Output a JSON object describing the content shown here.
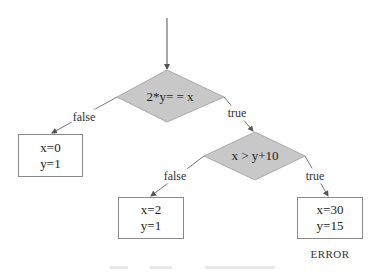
{
  "diagram": {
    "type": "flowchart",
    "colors": {
      "decision_fill": "#c8c8c8",
      "decision_stroke": "#999999",
      "edge": "#555555",
      "box_border": "#8a8a8a"
    },
    "decisions": [
      {
        "id": "d1",
        "text": "2*y= = x"
      },
      {
        "id": "d2",
        "text": "x > y+10"
      }
    ],
    "edges": [
      {
        "from": "start",
        "to": "d1",
        "label": ""
      },
      {
        "from": "d1",
        "to": "box1",
        "label": "false"
      },
      {
        "from": "d1",
        "to": "d2",
        "label": "true"
      },
      {
        "from": "d2",
        "to": "box2",
        "label": "false"
      },
      {
        "from": "d2",
        "to": "box3",
        "label": "true"
      }
    ],
    "boxes": [
      {
        "id": "box1",
        "line1": "x=0",
        "line2": "y=1"
      },
      {
        "id": "box2",
        "line1": "x=2",
        "line2": "y=1"
      },
      {
        "id": "box3",
        "line1": "x=30",
        "line2": "y=15",
        "note": "ERROR"
      }
    ]
  }
}
